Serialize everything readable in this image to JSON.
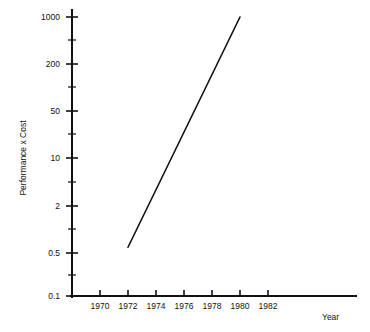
{
  "chart_data": {
    "type": "line",
    "title": "",
    "subtitle": "",
    "xlabel": "Year",
    "ylabel": "Performance x Cost",
    "grid": false,
    "legend": null,
    "yscale": "log",
    "xscale": "linear",
    "xlim": [
      1968.4,
      1987.6
    ],
    "ylim": [
      0.1,
      1600
    ],
    "x_ticks": [
      1970,
      1972,
      1974,
      1976,
      1978,
      1980,
      1982
    ],
    "x_tick_labels": [
      "1970",
      "1972",
      "1974",
      "1976",
      "1978",
      "1980",
      "1982"
    ],
    "y_ticks": [
      0.1,
      0.5,
      2,
      10,
      50,
      200,
      1000
    ],
    "y_tick_labels": [
      "0.1",
      "0.5",
      "2",
      "10",
      "50",
      "200",
      "1000"
    ],
    "y_minor_ticks": [
      0.22,
      1.0,
      4.5,
      22,
      100,
      450
    ],
    "series": [
      {
        "name": "Performance x Cost",
        "x": [
          1972,
          1980
        ],
        "y": [
          0.5,
          1000
        ]
      }
    ],
    "annotations": []
  },
  "axis": {
    "x_title": "Year",
    "y_title": "Performance x Cost"
  }
}
